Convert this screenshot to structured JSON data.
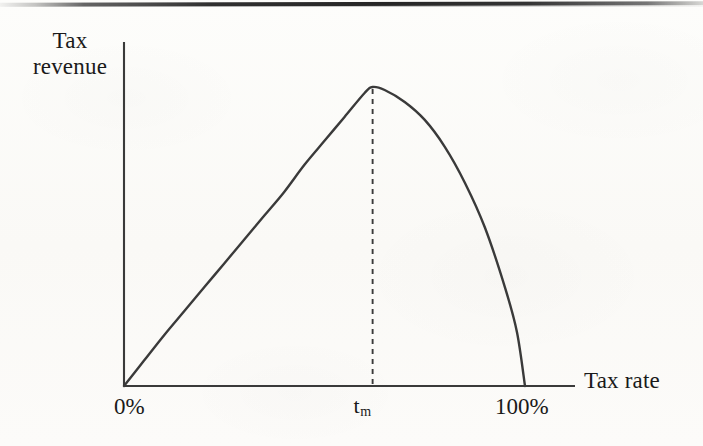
{
  "figure": {
    "kind": "laffer-curve-diagram",
    "background_color": "#fbfbf8",
    "ink_color": "#3a3a3a"
  },
  "labels": {
    "y_axis_line1": "Tax",
    "y_axis_line2": "revenue",
    "x_axis": "Tax rate",
    "tick_zero": "0%",
    "tick_peak_base": "t",
    "tick_peak_sub": "m",
    "tick_hundred": "100%"
  },
  "chart_data": {
    "type": "line",
    "title": "",
    "subtitle": "",
    "xlabel": "Tax rate",
    "ylabel": "Tax revenue",
    "xlim": [
      0,
      115
    ],
    "ylim": [
      0,
      105
    ],
    "grid": false,
    "legend": null,
    "xticks": [
      0,
      62,
      100
    ],
    "xticklabels": [
      "0%",
      "tm",
      "100%"
    ],
    "yticks": [],
    "yticklabels": [],
    "annotations": [
      {
        "name": "peak-dropline",
        "type": "dashed-vertical-line",
        "x": 62,
        "y_from": 0,
        "y_to": 100,
        "label": "tm"
      }
    ],
    "series": [
      {
        "name": "Tax revenue",
        "color": "#3a3a3a",
        "x": [
          0,
          5,
          10,
          15,
          20,
          25,
          30,
          35,
          40,
          45,
          50,
          55,
          60,
          62,
          65,
          70,
          75,
          80,
          85,
          90,
          95,
          98,
          100
        ],
        "y": [
          0,
          8.5,
          17,
          25,
          33,
          41,
          49,
          57,
          65,
          74,
          82,
          90,
          98,
          100,
          99,
          95,
          89,
          80,
          68,
          53,
          33,
          18,
          0
        ]
      }
    ]
  }
}
